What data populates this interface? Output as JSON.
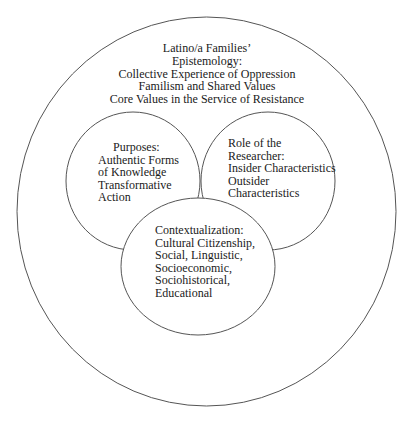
{
  "diagram": {
    "type": "nested-venn",
    "outer": {
      "lines": [
        "Latino/a Families’",
        "Epistemology:",
        "Collective Experience of Oppression",
        "Familism and Shared Values",
        "Core Values in the Service of Resistance"
      ]
    },
    "purposes": {
      "lines": [
        "Purposes:",
        "Authentic Forms",
        "of Knowledge",
        "Transformative",
        "Action"
      ]
    },
    "role": {
      "lines": [
        "Role of the",
        "Researcher:",
        "Insider Characteristics",
        "Outsider",
        "Characteristics"
      ]
    },
    "context": {
      "lines": [
        "Contextualization:",
        "Cultural Citizenship,",
        "Social, Linguistic,",
        "Socioeconomic,",
        "Sociohistorical,",
        "Educational"
      ]
    }
  },
  "colors": {
    "stroke": "#555555",
    "text": "#1a1a1a",
    "background": "#ffffff"
  }
}
